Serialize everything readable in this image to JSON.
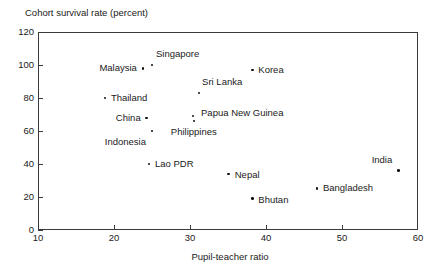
{
  "chart_data": {
    "type": "scatter",
    "title": "",
    "ylabel": "Cohort survival rate (percent)",
    "xlabel": "Pupil-teacher ratio",
    "xlim": [
      10,
      60
    ],
    "ylim": [
      0,
      120
    ],
    "xticks": [
      10,
      20,
      30,
      40,
      50,
      60
    ],
    "yticks": [
      0,
      20,
      40,
      60,
      80,
      100,
      120
    ],
    "grid": false,
    "legend": "none",
    "marker_color": "#111111",
    "frame_color": "#3a3a3a",
    "points": [
      {
        "label": "Singapore",
        "x": 25.0,
        "y": 100,
        "label_dx": 4,
        "label_dy": -11,
        "anchor": "anchor-left"
      },
      {
        "label": "Malaysia",
        "x": 23.8,
        "y": 98,
        "label_dx": -6,
        "label_dy": 0,
        "anchor": "anchor-right"
      },
      {
        "label": "Korea",
        "x": 38.2,
        "y": 97,
        "label_dx": 6,
        "label_dy": 0,
        "anchor": "anchor-left"
      },
      {
        "label": "Sri Lanka",
        "x": 31.2,
        "y": 83,
        "label_dx": 3,
        "label_dy": -11,
        "anchor": "anchor-left"
      },
      {
        "label": "Thailand",
        "x": 18.8,
        "y": 80,
        "label_dx": 6,
        "label_dy": 0,
        "anchor": "anchor-left"
      },
      {
        "label": "China",
        "x": 24.3,
        "y": 68,
        "label_dx": -6,
        "label_dy": 0,
        "anchor": "anchor-right"
      },
      {
        "label": "Papua New Guinea",
        "x": 30.4,
        "y": 69,
        "label_dx": 8,
        "label_dy": -3,
        "anchor": "anchor-left"
      },
      {
        "label": "Philippines",
        "x": 30.5,
        "y": 66,
        "label_dx": 0,
        "label_dy": 11,
        "anchor": "anchor-center"
      },
      {
        "label": "Indonesia",
        "x": 25.0,
        "y": 60,
        "label_dx": -6,
        "label_dy": 11,
        "anchor": "anchor-right"
      },
      {
        "label": "Lao PDR",
        "x": 24.6,
        "y": 40,
        "label_dx": 6,
        "label_dy": 0,
        "anchor": "anchor-left"
      },
      {
        "label": "Nepal",
        "x": 35.1,
        "y": 34,
        "label_dx": 6,
        "label_dy": 1,
        "anchor": "anchor-left"
      },
      {
        "label": "India",
        "x": 57.4,
        "y": 36,
        "label_dx": -6,
        "label_dy": -11,
        "anchor": "anchor-right"
      },
      {
        "label": "Bangladesh",
        "x": 46.7,
        "y": 25,
        "label_dx": 6,
        "label_dy": -1,
        "anchor": "anchor-left"
      },
      {
        "label": "Bhutan",
        "x": 38.2,
        "y": 19,
        "label_dx": 6,
        "label_dy": 1,
        "anchor": "anchor-left"
      }
    ]
  }
}
